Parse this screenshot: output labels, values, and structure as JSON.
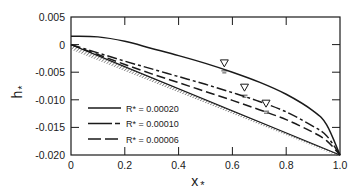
{
  "chart_data": {
    "type": "line",
    "title": "",
    "xlabel": "x*",
    "ylabel": "h*",
    "xlim": [
      0,
      1.0
    ],
    "ylim": [
      -0.02,
      0.005
    ],
    "x_ticks": [
      0,
      0.2,
      0.4,
      0.6,
      0.8,
      1.0
    ],
    "x_tick_labels": [
      "0",
      "0.2",
      "0.4",
      "0.6",
      "0.8",
      "1.0"
    ],
    "y_ticks": [
      0.005,
      0,
      -0.005,
      -0.01,
      -0.015,
      -0.02
    ],
    "y_tick_labels": [
      "0.005",
      "0",
      "-0.005",
      "-0.010",
      "-0.015",
      "-0.020"
    ],
    "grid": false,
    "legend_position": "lower-left inside",
    "x": [
      0,
      0.1,
      0.2,
      0.3,
      0.4,
      0.5,
      0.6,
      0.7,
      0.8,
      0.9,
      0.95,
      1.0
    ],
    "series": [
      {
        "name": "R* = 0.00020",
        "style": "solid",
        "values": [
          0.0015,
          0.0014,
          0.0006,
          -0.0007,
          -0.002,
          -0.0034,
          -0.005,
          -0.0068,
          -0.009,
          -0.012,
          -0.0145,
          -0.02
        ]
      },
      {
        "name": "R* = 0.00010",
        "style": "dash-dot",
        "values": [
          0.0,
          -0.0015,
          -0.003,
          -0.0044,
          -0.0058,
          -0.0072,
          -0.0087,
          -0.0103,
          -0.0122,
          -0.0148,
          -0.0165,
          -0.02
        ]
      },
      {
        "name": "R* = 0.00006",
        "style": "dashed",
        "values": [
          0.0,
          -0.0018,
          -0.0036,
          -0.0053,
          -0.0069,
          -0.0085,
          -0.0101,
          -0.0118,
          -0.0136,
          -0.0159,
          -0.0174,
          -0.02
        ]
      }
    ],
    "base_surface": {
      "name": "impermeable base (hatched)",
      "style": "hatched",
      "x": [
        0,
        1.0
      ],
      "values": [
        0.0,
        -0.02
      ]
    },
    "annotations": [
      {
        "type": "water-table-marker",
        "glyph": "∇",
        "x": 0.57,
        "y": -0.0044,
        "series": "R* = 0.00020"
      },
      {
        "type": "water-table-marker",
        "glyph": "∇",
        "x": 0.645,
        "y": -0.0088,
        "series": "R* = 0.00010"
      },
      {
        "type": "water-table-marker",
        "glyph": "∇",
        "x": 0.725,
        "y": -0.0117,
        "series": "R* = 0.00006"
      }
    ]
  },
  "legend": {
    "items": [
      {
        "label": "R* = 0.00020",
        "style": "solid"
      },
      {
        "label": "R* = 0.00010",
        "style": "dash-dot"
      },
      {
        "label": "R* = 0.00006",
        "style": "dashed"
      }
    ]
  },
  "labels": {
    "xlabel": "x",
    "xlabel_sub": "*",
    "ylabel": "h",
    "ylabel_sub": "*"
  }
}
